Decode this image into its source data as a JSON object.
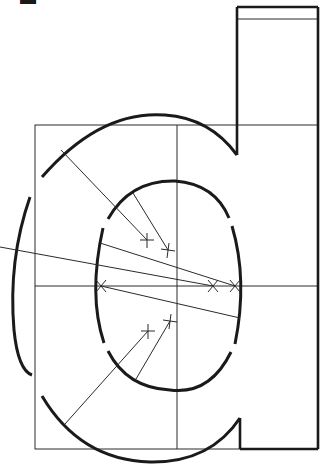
{
  "figure": {
    "corner_mark": "▬",
    "colors": {
      "ink": "#1a1a1a",
      "construction": "#2a2a2a",
      "background": "#ffffff"
    }
  },
  "elements": {
    "bounding_box": {
      "x": 35,
      "y": 125,
      "width": 283,
      "height": 324
    },
    "center_vertical_line_x": 177,
    "center_horizontal_line_y": 286,
    "stem": {
      "left": 237,
      "right": 318,
      "top": 7,
      "band_y": 19,
      "bottom": 449
    },
    "outer_bowl": {
      "cx": 140,
      "cy": 290,
      "rx": 122,
      "ry": 178
    },
    "inner_bowl": {
      "cx": 168,
      "cy": 270,
      "rx": 73,
      "ry": 92
    },
    "compass_centers": [
      {
        "x": 147,
        "y": 240
      },
      {
        "x": 168,
        "y": 250
      },
      {
        "x": 101,
        "y": 286
      },
      {
        "x": 213,
        "y": 286
      },
      {
        "x": 235,
        "y": 286
      },
      {
        "x": 148,
        "y": 331
      },
      {
        "x": 170,
        "y": 321
      }
    ]
  }
}
